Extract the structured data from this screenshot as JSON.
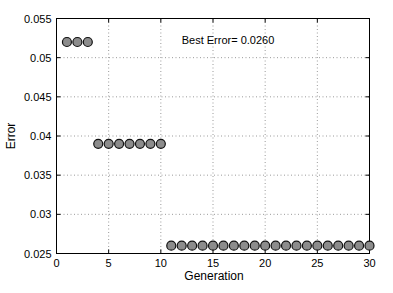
{
  "figure": {
    "background": "#ffffff"
  },
  "chart_data": {
    "type": "scatter",
    "title": "",
    "xlabel": "Generation",
    "ylabel": "Error",
    "xlim": [
      0,
      30
    ],
    "ylim": [
      0.025,
      0.055
    ],
    "xticks": [
      0,
      5,
      10,
      15,
      20,
      25,
      30
    ],
    "xtick_labels": [
      "0",
      "5",
      "10",
      "15",
      "20",
      "25",
      "30"
    ],
    "yticks": [
      0.025,
      0.03,
      0.035,
      0.04,
      0.045,
      0.05,
      0.055
    ],
    "ytick_labels": [
      "0.025",
      "0.03",
      "0.035",
      "0.04",
      "0.045",
      "0.05",
      "0.055"
    ],
    "grid": true,
    "grid_style": "dotted",
    "annotation": {
      "text": "Best Error= 0.0260",
      "x": 12,
      "y": 0.0523
    },
    "series": [
      {
        "name": "best-error-per-generation",
        "x": [
          1,
          2,
          3,
          4,
          5,
          6,
          7,
          8,
          9,
          10,
          11,
          12,
          13,
          14,
          15,
          16,
          17,
          18,
          19,
          20,
          21,
          22,
          23,
          24,
          25,
          26,
          27,
          28,
          29,
          30
        ],
        "y": [
          0.052,
          0.052,
          0.052,
          0.039,
          0.039,
          0.039,
          0.039,
          0.039,
          0.039,
          0.039,
          0.026,
          0.026,
          0.026,
          0.026,
          0.026,
          0.026,
          0.026,
          0.026,
          0.026,
          0.026,
          0.026,
          0.026,
          0.026,
          0.026,
          0.026,
          0.026,
          0.026,
          0.026,
          0.026,
          0.026
        ],
        "marker": {
          "shape": "circle",
          "fill": "#8c8c8c",
          "stroke": "#111111",
          "radius": 4.5
        }
      }
    ],
    "colors": {
      "frame": "#000000",
      "grid": "#9a9a9a",
      "tick": "#000000",
      "text": "#000000",
      "background": "#ffffff"
    }
  }
}
